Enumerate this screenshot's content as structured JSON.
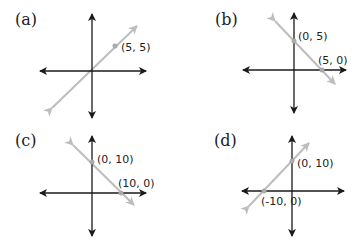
{
  "colors": {
    "axis": "#1a1a1a",
    "line": "#bdbdbd",
    "point": "#aaaaaa"
  },
  "panels": [
    {
      "label": "(a)",
      "points": [
        {
          "text": "(5, 5)"
        }
      ]
    },
    {
      "label": "(b)",
      "points": [
        {
          "text": "(0, 5)"
        },
        {
          "text": "(5, 0)"
        }
      ]
    },
    {
      "label": "(c)",
      "points": [
        {
          "text": "(0, 10)"
        },
        {
          "text": "(10, 0)"
        }
      ]
    },
    {
      "label": "(d)",
      "points": [
        {
          "text": "(0, 10)"
        },
        {
          "text": "(-10, 0)"
        }
      ]
    }
  ]
}
